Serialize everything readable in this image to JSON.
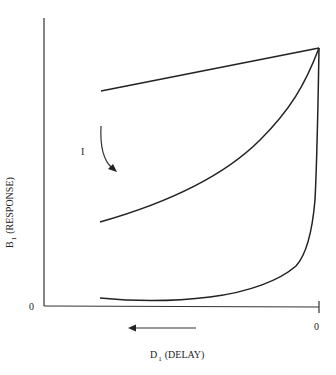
{
  "diagram": {
    "y_axis": {
      "symbol": "B",
      "subscript": "1",
      "label": "(RESPONSE)",
      "origin_tick": "0"
    },
    "x_axis": {
      "symbol": "D",
      "subscript": "1",
      "label": "(DELAY)",
      "origin_tick": "0",
      "direction_arrow": "left"
    },
    "annotation": {
      "label": "I",
      "arrow": "curved-down"
    },
    "curves": [
      {
        "name": "upper-linear",
        "shape": "nearly linear rising toward apex"
      },
      {
        "name": "middle-convex",
        "shape": "convex rising toward apex"
      },
      {
        "name": "lower-hyperbolic",
        "shape": "flat near zero, sharp rise near D=0"
      }
    ],
    "colors": {
      "stroke": "#222222",
      "background": "#ffffff"
    }
  }
}
